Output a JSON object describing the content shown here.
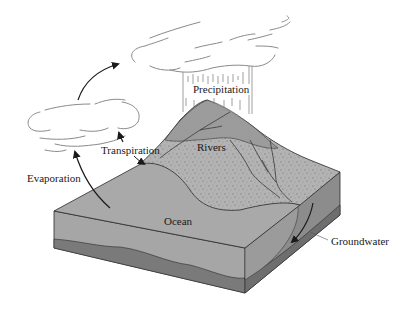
{
  "diagram": {
    "labels": {
      "precipitation": "Precipitation",
      "transpiration": "Transpiration",
      "rivers": "Rivers",
      "evaporation": "Evaporation",
      "ocean": "Ocean",
      "groundwater": "Groundwater"
    },
    "colors": {
      "background": "#ffffff",
      "ocean_top": "#a9a9a9",
      "land_top": "#b3b3b3",
      "mountain": "#9a9a9a",
      "block_front": "#a6a6a6",
      "block_side": "#8c8c8c",
      "bedrock": "#7a7a7a",
      "outline": "#2a2a2a",
      "cloud_stroke": "#8a8a8a",
      "arrow": "#1a1a1a"
    }
  }
}
